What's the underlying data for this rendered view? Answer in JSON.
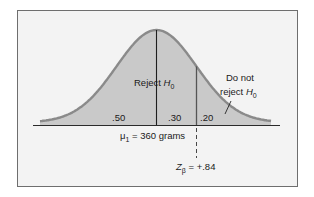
{
  "chart_data": {
    "type": "area",
    "title": "",
    "distribution": "normal",
    "mean_label": "μ1 = 360 grams",
    "mean": {
      "symbol": "μ",
      "subscript": "1",
      "value": "360",
      "unit": "grams"
    },
    "critical_z": {
      "symbol": "Z",
      "subscript": "β",
      "value": "+.84"
    },
    "regions": [
      {
        "label": ".50",
        "value": 0.5,
        "from": "-inf",
        "to": "mean"
      },
      {
        "label": ".30",
        "value": 0.3,
        "from": "mean",
        "to": "critical"
      },
      {
        "label": ".20",
        "value": 0.2,
        "from": "critical",
        "to": "+inf"
      }
    ],
    "annotations": [
      {
        "text": "Reject H0",
        "region": "left-of-critical"
      },
      {
        "text": "Do not reject H0",
        "region": "right-tail",
        "pointer": true
      }
    ],
    "grid": false,
    "legend": null
  },
  "labels": {
    "reject": {
      "main": "Reject ",
      "italic": "H",
      "sub": "0"
    },
    "do_not_line1": "Do not",
    "do_not_line2": {
      "main": "reject ",
      "italic": "H",
      "sub": "0"
    },
    "area_left": ".50",
    "area_mid": ".30",
    "area_right": ".20",
    "mu": {
      "symbol": "μ",
      "sub": "1",
      "rest": " = 360 grams"
    },
    "z": {
      "symbol": "Z",
      "sub": "β",
      "rest": " = +.84"
    }
  },
  "colors": {
    "background": "#f3f3f3",
    "fill": "#c9c9c9",
    "curve": "#8a8a8a",
    "axis": "#2a2a2a",
    "frame": "#6e6e6e"
  }
}
